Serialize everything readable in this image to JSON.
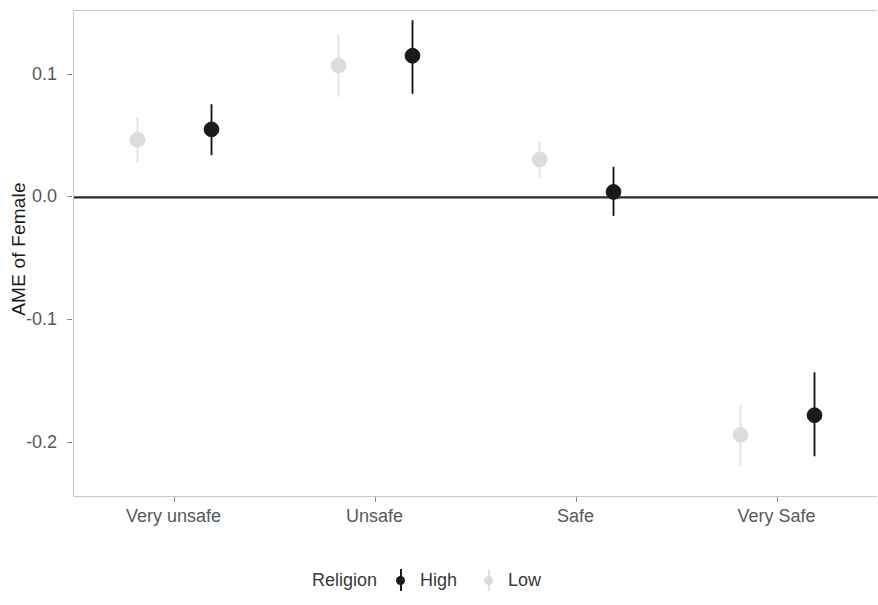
{
  "chart_data": {
    "type": "scatter",
    "title": "",
    "subtitle": "",
    "xlabel": "",
    "ylabel": "AME of Female",
    "categories": [
      "Very unsafe",
      "Unsafe",
      "Safe",
      "Very Safe"
    ],
    "yticks": [
      "0.1",
      "0.0",
      "-0.1",
      "-0.2"
    ],
    "ytick_values": [
      0.1,
      0.0,
      -0.1,
      -0.2
    ],
    "ylim": [
      -0.245,
      0.152
    ],
    "grid": false,
    "legend_position": "bottom",
    "legend_title": "Religion",
    "reference_line": 0.0,
    "series": [
      {
        "name": "High",
        "color": "#1a1a1a",
        "values": [
          0.0555,
          0.1155,
          0.0045,
          -0.1775
        ],
        "ci_low": [
          0.0345,
          0.0845,
          -0.015,
          -0.211
        ],
        "ci_high": [
          0.076,
          0.1445,
          0.025,
          -0.1425
        ]
      },
      {
        "name": "Low",
        "color": "#dcdcdc",
        "values": [
          0.047,
          0.1075,
          0.031,
          -0.1935
        ],
        "ci_low": [
          0.0285,
          0.082,
          0.0155,
          -0.2185
        ],
        "ci_high": [
          0.0655,
          0.133,
          0.046,
          -0.169
        ]
      }
    ]
  },
  "legend": {
    "title": "Religion",
    "entries": [
      {
        "label": "High",
        "color": "#1a1a1a"
      },
      {
        "label": "Low",
        "color": "#dcdcdc"
      }
    ]
  },
  "axes": {
    "y_title": "AME of Female",
    "y_tick_labels": [
      "0.1",
      "0.0",
      "-0.1",
      "-0.2"
    ],
    "x_tick_labels": [
      "Very unsafe",
      "Unsafe",
      "Safe",
      "Very Safe"
    ]
  },
  "colors": {
    "high": "#1a1a1a",
    "low": "#dcdcdc",
    "panel_border": "#c8c8c8",
    "tick_text": "#585858",
    "axis_title": "#1a1a1a",
    "zero_line": "#2b2b2b"
  }
}
